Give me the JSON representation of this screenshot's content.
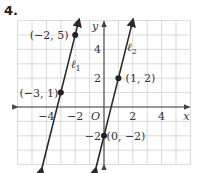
{
  "problem_number": "4.",
  "chart_data": {
    "type": "line",
    "title": "",
    "xlabel": "x",
    "ylabel": "y",
    "xlim": [
      -6,
      6
    ],
    "ylim": [
      -4,
      6
    ],
    "grid": true,
    "x_ticks": [
      -4,
      -2,
      2,
      4
    ],
    "y_ticks": [
      -2,
      2,
      4
    ],
    "x_tick_labels": [
      "−4",
      "−2",
      "2",
      "4"
    ],
    "y_tick_labels": [
      "−2",
      "2",
      "4"
    ],
    "origin_label": "O",
    "series": [
      {
        "name": "ℓ1",
        "label_main": "ℓ",
        "label_sub": "1",
        "slope": 4,
        "points": [
          {
            "x": -3,
            "y": 1,
            "label": "(−3, 1)"
          },
          {
            "x": -2,
            "y": 5,
            "label": "(−2, 5)"
          }
        ]
      },
      {
        "name": "ℓ2",
        "label_main": "ℓ",
        "label_sub": "2",
        "slope": 4,
        "points": [
          {
            "x": 0,
            "y": -2,
            "label": "(0, −2)"
          },
          {
            "x": 1,
            "y": 2,
            "label": "(1, 2)"
          }
        ]
      }
    ],
    "colors": {
      "grid": "#cfcfcf",
      "axis": "#444444",
      "line": "#2a2a2a",
      "point": "#222222"
    }
  }
}
